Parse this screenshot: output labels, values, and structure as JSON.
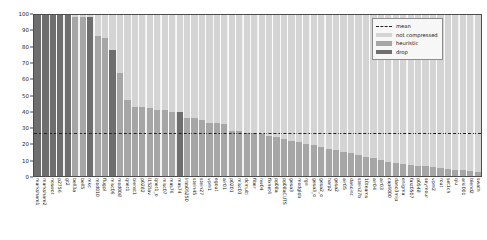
{
  "chart_data": {
    "type": "bar",
    "title": "",
    "xlabel": "",
    "ylabel": "",
    "ylim": [
      0,
      100
    ],
    "yticks": [
      0,
      10,
      20,
      30,
      40,
      50,
      60,
      70,
      80,
      90,
      100
    ],
    "grid": true,
    "legend_position": "upper right",
    "mean": 27,
    "legend": [
      {
        "label": "mean",
        "key": "mean",
        "color": "#222222"
      },
      {
        "label": "not compressed",
        "key": "notcompressed",
        "color": "#d4d4d4"
      },
      {
        "label": "heuristic",
        "key": "heuristic",
        "color": "#a6a6a6"
      },
      {
        "label": "drop",
        "key": "drop",
        "color": "#6e6e6e"
      }
    ],
    "categories": [
      "markshare1",
      "markshare2",
      "noswot",
      "p2756",
      "gt2",
      "bell3a",
      "bell5",
      "mkc",
      "mod010",
      "flugpl",
      "misc06",
      "mod008",
      "qnet1",
      "bienst1",
      "p0282",
      "l152lav",
      "qnet1_o",
      "misc07",
      "mas76",
      "mas74",
      "lrbb05250",
      "stein45",
      "stein27",
      "vpm1",
      "egout",
      "air01",
      "p0201",
      "misc03",
      "dcmulti",
      "fiber",
      "nw04",
      "fixnet6",
      "pp08a",
      "pp08aCUTS",
      "gesa3",
      "modglob",
      "rgn",
      "gesa3_o",
      "gesa2_o",
      "harp2",
      "gesa2",
      "air05",
      "danoint",
      "stein27b",
      "10teams",
      "air04",
      "air03",
      "cap6000",
      "dano3mip",
      "enigma",
      "fast0507",
      "p0548",
      "seymour",
      "vpm2",
      "rout",
      "set1ch",
      "qiu",
      "arki001",
      "blend2",
      "swath"
    ],
    "values": [
      100,
      100,
      100,
      100,
      100,
      99,
      98.5,
      98.5,
      87,
      86,
      78,
      64,
      47,
      43,
      43,
      42,
      41,
      41,
      40,
      40,
      36,
      36,
      35,
      33,
      33,
      32,
      28,
      28,
      27,
      27,
      26,
      25,
      24,
      23,
      22,
      21,
      20,
      19,
      18,
      17,
      16,
      15,
      14,
      13,
      12,
      11,
      10,
      9,
      8,
      7.5,
      7,
      6.5,
      6,
      5.5,
      5,
      4.5,
      4,
      3.5,
      3,
      2.5
    ],
    "bar_types": [
      "drop",
      "drop",
      "drop",
      "drop",
      "drop",
      "heuristic",
      "heuristic",
      "drop",
      "heuristic",
      "heuristic",
      "drop",
      "heuristic",
      "heuristic",
      "heuristic",
      "heuristic",
      "heuristic",
      "heuristic",
      "heuristic",
      "heuristic",
      "drop",
      "heuristic",
      "heuristic",
      "heuristic",
      "heuristic",
      "heuristic",
      "heuristic",
      "heuristic",
      "heuristic",
      "heuristic",
      "heuristic",
      "heuristic",
      "heuristic",
      "heuristic",
      "heuristic",
      "heuristic",
      "heuristic",
      "heuristic",
      "heuristic",
      "heuristic",
      "heuristic",
      "heuristic",
      "heuristic",
      "heuristic",
      "heuristic",
      "heuristic",
      "heuristic",
      "heuristic",
      "heuristic",
      "heuristic",
      "heuristic",
      "heuristic",
      "heuristic",
      "heuristic",
      "heuristic",
      "heuristic",
      "heuristic",
      "heuristic",
      "heuristic",
      "heuristic",
      "heuristic"
    ],
    "background_values": [
      100,
      100,
      100,
      100,
      100,
      100,
      100,
      100,
      100,
      100,
      100,
      100,
      100,
      100,
      100,
      100,
      100,
      100,
      100,
      100,
      100,
      100,
      100,
      100,
      100,
      100,
      100,
      100,
      100,
      100,
      100,
      100,
      100,
      100,
      100,
      100,
      100,
      100,
      100,
      100,
      100,
      100,
      100,
      100,
      100,
      100,
      100,
      100,
      100,
      100,
      100,
      100,
      100,
      100,
      100,
      100,
      100,
      100,
      100,
      100
    ]
  }
}
